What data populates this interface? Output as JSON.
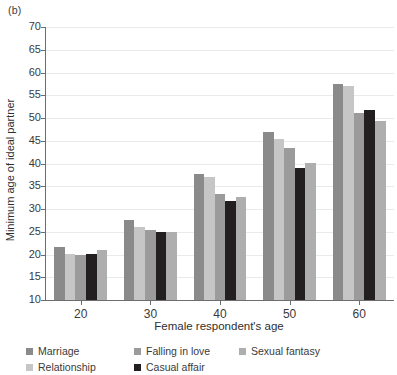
{
  "panel_label": "(b)",
  "chart_data": {
    "type": "bar",
    "title": "",
    "subtitle": "",
    "xlabel": "Female respondent's age",
    "ylabel": "Minimum age of ideal partner",
    "categories": [
      "20",
      "30",
      "40",
      "50",
      "60"
    ],
    "ylim": [
      10,
      70
    ],
    "yticks": [
      10,
      15,
      20,
      25,
      30,
      35,
      40,
      45,
      50,
      55,
      60,
      65,
      70
    ],
    "ytick_labels": [
      "10",
      "15",
      "20",
      "25",
      "30",
      "35",
      "40",
      "45",
      "50",
      "55",
      "60",
      "65",
      "70"
    ],
    "grid": true,
    "grid_axis": "y",
    "legend_position": "below-plot",
    "legend_columns": 3,
    "series": [
      {
        "name": "Marriage",
        "color": "#8a8a8a",
        "values": [
          21.7,
          27.6,
          37.7,
          47.0,
          57.5
        ]
      },
      {
        "name": "Relationship",
        "color": "#c6c6c6",
        "values": [
          20.2,
          26.1,
          37.0,
          45.3,
          57.1
        ]
      },
      {
        "name": "Falling in love",
        "color": "#9b9b9b",
        "values": [
          20.0,
          25.3,
          33.3,
          43.4,
          51.1
        ]
      },
      {
        "name": "Casual affair",
        "color": "#231f20",
        "values": [
          20.2,
          24.9,
          31.7,
          39.0,
          51.8
        ]
      },
      {
        "name": "Sexual fantasy",
        "color": "#aeaeae",
        "values": [
          20.9,
          25.0,
          32.6,
          40.2,
          49.4
        ]
      }
    ],
    "legend_order": [
      "Marriage",
      "Falling in love",
      "Sexual fantasy",
      "Relationship",
      "Casual affair"
    ]
  },
  "axis_color": "#6d6d6d",
  "grid_color": "#e9eaec"
}
